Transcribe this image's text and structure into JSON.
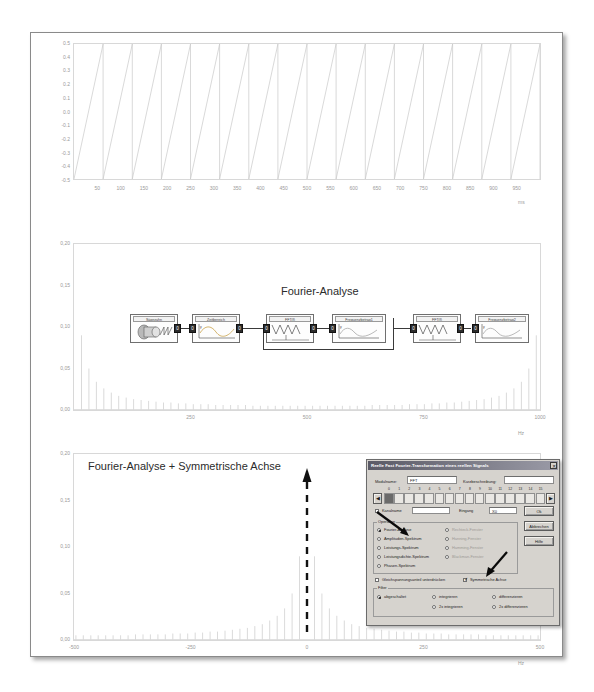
{
  "page": {
    "background": "#ffffff",
    "border_color": "#8a8a8a"
  },
  "chart_data": [
    {
      "type": "line",
      "title": "",
      "xlabel": "ms",
      "ylabel": "",
      "xlim": [
        0,
        1000
      ],
      "ylim": [
        -0.5,
        0.5
      ],
      "xticks": [
        50,
        100,
        150,
        200,
        250,
        300,
        350,
        400,
        450,
        500,
        550,
        600,
        650,
        700,
        750,
        800,
        850,
        900,
        950
      ],
      "xticklabels": [
        "50",
        "100",
        "150",
        "200",
        "250",
        "300",
        "350",
        "400",
        "450",
        "500",
        "550",
        "600",
        "650",
        "700",
        "750",
        "800",
        "850",
        "900",
        "950"
      ],
      "yticks": [
        -0.5,
        -0.4,
        -0.3,
        -0.2,
        -0.1,
        0.0,
        0.1,
        0.2,
        0.3,
        0.4,
        0.5
      ],
      "yticklabels": [
        "-0.5",
        "-0.4",
        "-0.3",
        "-0.2",
        "-0.1",
        "0.0",
        "0.1",
        "0.2",
        "0.3",
        "0.4",
        "0.5"
      ],
      "series": [
        {
          "name": "Sägezahn",
          "waveform": "sawtooth",
          "period_ms": 62.5,
          "amplitude": 0.5,
          "cycles": 16,
          "color": "#c9c9c9"
        }
      ],
      "grid": false,
      "legend": "none"
    },
    {
      "type": "bar",
      "title": "Fourier-Analyse",
      "xlabel": "Hz",
      "ylabel": "",
      "xlim": [
        0,
        1000
      ],
      "ylim": [
        0.0,
        0.2
      ],
      "xticks": [
        250,
        500,
        750,
        1000
      ],
      "xticklabels": [
        "250",
        "500",
        "750",
        "1000"
      ],
      "yticks": [
        0.0,
        0.05,
        0.1,
        0.15,
        0.2
      ],
      "yticklabels": [
        "0,00",
        "0,05",
        "0,10",
        "0,15",
        "0,20"
      ],
      "description": "Amplitudenspektrum eines Sägezahns: Harmonische mit 1/n-Abfall, gespiegelt zur Nyquist-Frequenz",
      "harmonics_x": [
        16,
        32,
        48,
        64,
        80,
        96,
        112,
        128,
        144,
        160,
        176,
        192,
        208,
        224,
        240,
        256,
        272,
        288,
        304,
        320,
        336,
        352,
        368,
        384,
        400,
        416,
        432,
        448,
        464,
        480,
        496,
        512,
        528,
        544,
        560,
        576,
        592,
        608,
        624,
        640,
        656,
        672,
        688,
        704,
        720,
        736,
        752,
        768,
        784,
        800,
        816,
        832,
        848,
        864,
        880,
        896,
        912,
        928,
        944,
        960,
        976,
        992
      ],
      "harmonics_y": [
        0.09,
        0.05,
        0.034,
        0.026,
        0.021,
        0.017,
        0.015,
        0.013,
        0.012,
        0.011,
        0.01,
        0.009,
        0.009,
        0.008,
        0.008,
        0.007,
        0.007,
        0.007,
        0.006,
        0.006,
        0.006,
        0.006,
        0.006,
        0.005,
        0.005,
        0.005,
        0.005,
        0.005,
        0.005,
        0.005,
        0.005,
        0.005,
        0.005,
        0.005,
        0.005,
        0.005,
        0.005,
        0.005,
        0.005,
        0.006,
        0.006,
        0.006,
        0.006,
        0.006,
        0.007,
        0.007,
        0.007,
        0.008,
        0.008,
        0.009,
        0.009,
        0.01,
        0.011,
        0.012,
        0.013,
        0.015,
        0.017,
        0.021,
        0.026,
        0.034,
        0.05,
        0.09
      ],
      "grid": false,
      "legend": "none"
    },
    {
      "type": "bar",
      "title": "Fourier-Analyse + Symmetrische Achse",
      "xlabel": "Hz",
      "ylabel": "",
      "xlim": [
        -500,
        500
      ],
      "ylim": [
        0.0,
        0.2
      ],
      "xticks": [
        -500,
        -250,
        0,
        250,
        500
      ],
      "xticklabels": [
        "-500",
        "-250",
        "0",
        "250",
        "500"
      ],
      "yticks": [
        0.0,
        0.05,
        0.1,
        0.15,
        0.2
      ],
      "yticklabels": [
        "0,00",
        "0,05",
        "0,10",
        "0,15",
        "0,20"
      ],
      "description": "Gleiches Spektrum, jedoch symmetrisch um 0 Hz zentriert; Maximum nahe 0 Hz",
      "harmonics_x": [
        -496,
        -480,
        -464,
        -448,
        -432,
        -416,
        -400,
        -384,
        -368,
        -352,
        -336,
        -320,
        -304,
        -288,
        -272,
        -256,
        -240,
        -224,
        -208,
        -192,
        -176,
        -160,
        -144,
        -128,
        -112,
        -96,
        -80,
        -64,
        -48,
        -32,
        -16,
        16,
        32,
        48,
        64,
        80,
        96,
        112,
        128,
        144,
        160,
        176,
        192,
        208,
        224,
        240,
        256,
        272,
        288,
        304,
        320,
        336,
        352,
        368,
        384,
        400,
        416,
        432,
        448,
        464,
        480,
        496
      ],
      "harmonics_y": [
        0.005,
        0.005,
        0.005,
        0.005,
        0.005,
        0.005,
        0.005,
        0.005,
        0.006,
        0.006,
        0.006,
        0.006,
        0.006,
        0.007,
        0.007,
        0.007,
        0.008,
        0.008,
        0.009,
        0.009,
        0.01,
        0.011,
        0.012,
        0.013,
        0.015,
        0.017,
        0.021,
        0.026,
        0.034,
        0.05,
        0.09,
        0.09,
        0.05,
        0.034,
        0.026,
        0.021,
        0.017,
        0.015,
        0.013,
        0.012,
        0.011,
        0.01,
        0.009,
        0.009,
        0.008,
        0.008,
        0.007,
        0.007,
        0.007,
        0.006,
        0.006,
        0.006,
        0.006,
        0.006,
        0.005,
        0.005,
        0.005,
        0.005,
        0.005,
        0.005,
        0.005,
        0.005
      ],
      "annotation": {
        "type": "dashed-arrow",
        "direction": "up",
        "at_x": 0
      },
      "grid": false,
      "legend": "none"
    }
  ],
  "diagram": {
    "title": "Fourier-Analyse",
    "blocks": [
      {
        "id": "saegezahn",
        "label": "Sägezahn",
        "icon": "generator-icon"
      },
      {
        "id": "zeitbereich",
        "label": "Zeitbereich",
        "icon": "timeplot-icon"
      },
      {
        "id": "fft1",
        "label": "FFT(f)",
        "icon": "spectrum-icon"
      },
      {
        "id": "frequenzbetrag1",
        "label": "Frequenzbetrag1",
        "icon": "magnitude-icon"
      },
      {
        "id": "fft2",
        "label": "FFT(f)",
        "icon": "spectrum-icon"
      },
      {
        "id": "frequenzbetrag2",
        "label": "Frequenzbetrag2",
        "icon": "magnitude-icon"
      }
    ],
    "port_label": "0"
  },
  "dialog": {
    "title": "Reelle Fast Fourier-Transformation eines reellen Signals",
    "close_label": "✕",
    "modulname_label": "Modulname:",
    "modulname_value": "FFT",
    "kurzbeschreibung_label": "Kurzbeschreibung:",
    "kurzbeschreibung_value": "",
    "slider_numbers": [
      "0",
      "1",
      "2",
      "3",
      "4",
      "5",
      "6",
      "7",
      "8",
      "9",
      "10",
      "11",
      "12",
      "13",
      "14",
      "15"
    ],
    "slider_selected_index": 0,
    "nav_prev": "◀",
    "nav_next": "▶",
    "kanalname_label": "Kanalname",
    "kanalname_checked": false,
    "kanalname_value": "",
    "eingang_label": "Eingang",
    "eingang_value": "X0",
    "buttons": {
      "ok": "Ok",
      "cancel": "Abbrechen",
      "help": "Hilfe"
    },
    "operation_group": "Operation",
    "operation_options": [
      {
        "label": "Fourier-Analyse",
        "selected": true
      },
      {
        "label": "Amplituden-Spektrum",
        "selected": false
      },
      {
        "label": "Leistungs-Spektrum",
        "selected": false
      },
      {
        "label": "Leistungsdichte-Spektrum",
        "selected": false
      },
      {
        "label": "Phasen-Spektrum",
        "selected": false
      }
    ],
    "window_options": [
      {
        "label": "Rechteck-Fenster",
        "selected": false,
        "disabled": true
      },
      {
        "label": "Hanning-Fenster",
        "selected": false,
        "disabled": true
      },
      {
        "label": "Hamming-Fenster",
        "selected": false,
        "disabled": true
      },
      {
        "label": "Blackman-Fenster",
        "selected": false,
        "disabled": true
      }
    ],
    "dc_checkbox_label": "Gleichspannungsanteil unterdrücken",
    "dc_checked": false,
    "symmetric_checkbox_label": "Symmetrische Achse",
    "symmetric_checked": true,
    "filter_group": "Filter",
    "filter_options": [
      {
        "label": "abgeschaltet",
        "selected": true
      },
      {
        "label": "integrieren",
        "selected": false
      },
      {
        "label": "differenzieren",
        "selected": false
      },
      {
        "label": "2x integrieren",
        "selected": false
      },
      {
        "label": "2x differenzieren",
        "selected": false
      }
    ]
  }
}
